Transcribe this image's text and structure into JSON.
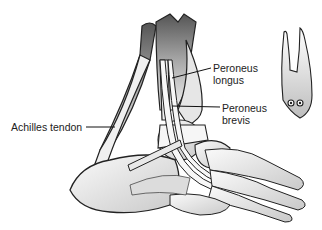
{
  "diagram": {
    "labels": {
      "peroneus_longus_line1": "Peroneus",
      "peroneus_longus_line2": "longus",
      "peroneus_brevis_line1": "Peroneus",
      "peroneus_brevis_line2": "brevis",
      "achilles": "Achilles tendon"
    },
    "inset": "cross-section of tendon sheath with two tendons"
  }
}
